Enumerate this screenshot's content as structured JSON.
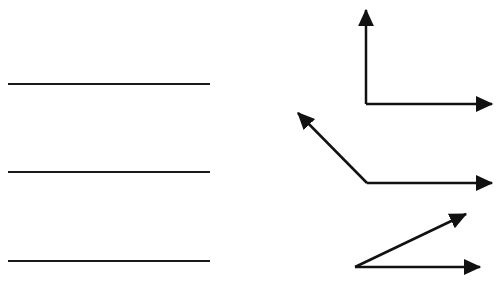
{
  "diagram": {
    "colors": {
      "background": "#ffffff",
      "stroke": "#111111"
    },
    "lines": [
      {
        "name": "line-1",
        "x1": 8,
        "y1": 84,
        "x2": 210,
        "y2": 84
      },
      {
        "name": "line-2",
        "x1": 8,
        "y1": 172,
        "x2": 210,
        "y2": 172
      },
      {
        "name": "line-3",
        "x1": 8,
        "y1": 261,
        "x2": 210,
        "y2": 261
      }
    ],
    "angles": [
      {
        "name": "right-angle",
        "type": "right",
        "vertex": [
          366,
          104
        ],
        "ray_a_end": [
          366,
          10
        ],
        "ray_b_end": [
          492,
          104
        ]
      },
      {
        "name": "obtuse-angle",
        "type": "obtuse",
        "vertex": [
          367,
          183
        ],
        "ray_a_end": [
          298,
          113
        ],
        "ray_b_end": [
          492,
          183
        ]
      },
      {
        "name": "acute-angle",
        "type": "acute",
        "vertex": [
          355,
          267
        ],
        "ray_a_end": [
          466,
          214
        ],
        "ray_b_end": [
          480,
          267
        ]
      }
    ]
  }
}
